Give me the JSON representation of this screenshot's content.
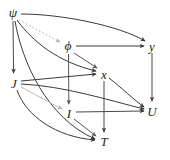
{
  "diagram": {
    "type": "directed-acyclic-graph",
    "background_color": "#ffffff",
    "default_edge_color": "#3a3a3a",
    "faded_edge_color": "#b0b0b0",
    "label_color": "#262626",
    "nodes": [
      {
        "id": "psi",
        "label": "ψ",
        "x": 13,
        "y": 13,
        "kind": "greek"
      },
      {
        "id": "phi",
        "label": "ϕ",
        "x": 68,
        "y": 46,
        "kind": "greek"
      },
      {
        "id": "y",
        "label": "y",
        "x": 152,
        "y": 46,
        "kind": "latin"
      },
      {
        "id": "J",
        "label": "J",
        "x": 14,
        "y": 83,
        "kind": "latin"
      },
      {
        "id": "x",
        "label": "x",
        "x": 104,
        "y": 74,
        "kind": "latin"
      },
      {
        "id": "I",
        "label": "I",
        "x": 69,
        "y": 113,
        "kind": "latin"
      },
      {
        "id": "U",
        "label": "U",
        "x": 152,
        "y": 111,
        "kind": "latin"
      },
      {
        "id": "T",
        "label": "T",
        "x": 104,
        "y": 141,
        "kind": "latin"
      }
    ],
    "edges": [
      {
        "id": "psi-phi",
        "from": "psi",
        "to": "phi",
        "style": "dotted",
        "color": "#b5b5b5",
        "shape": "straight"
      },
      {
        "id": "psi-J",
        "from": "psi",
        "to": "J",
        "style": "solid",
        "color": "#4a4a4a",
        "shape": "straight"
      },
      {
        "id": "psi-x",
        "from": "psi",
        "to": "x",
        "style": "solid",
        "color": "#3a3a3a",
        "shape": "curve"
      },
      {
        "id": "psi-y",
        "from": "psi",
        "to": "y",
        "style": "solid",
        "color": "#3a3a3a",
        "shape": "curve"
      },
      {
        "id": "psi-T",
        "from": "psi",
        "to": "T",
        "style": "solid",
        "color": "#3a3a3a",
        "shape": "curve"
      },
      {
        "id": "phi-x",
        "from": "phi",
        "to": "x",
        "style": "solid",
        "color": "#555555",
        "shape": "straight"
      },
      {
        "id": "phi-y",
        "from": "phi",
        "to": "y",
        "style": "solid",
        "color": "#3a3a3a",
        "shape": "straight"
      },
      {
        "id": "phi-I",
        "from": "phi",
        "to": "I",
        "style": "solid",
        "color": "#5a5a5a",
        "shape": "straight"
      },
      {
        "id": "J-x",
        "from": "J",
        "to": "x",
        "style": "solid",
        "color": "#3a3a3a",
        "shape": "straight"
      },
      {
        "id": "J-I",
        "from": "J",
        "to": "I",
        "style": "solid",
        "color": "#bdbdbd",
        "shape": "straight"
      },
      {
        "id": "J-U",
        "from": "J",
        "to": "U",
        "style": "solid",
        "color": "#3a3a3a",
        "shape": "curve"
      },
      {
        "id": "J-T",
        "from": "J",
        "to": "T",
        "style": "solid",
        "color": "#3a3a3a",
        "shape": "curve"
      },
      {
        "id": "x-U",
        "from": "x",
        "to": "U",
        "style": "solid",
        "color": "#3a3a3a",
        "shape": "curve"
      },
      {
        "id": "x-T",
        "from": "x",
        "to": "T",
        "style": "solid",
        "color": "#4a4a4a",
        "shape": "straight"
      },
      {
        "id": "I-U",
        "from": "I",
        "to": "U",
        "style": "solid",
        "color": "#4a4a4a",
        "shape": "straight"
      },
      {
        "id": "I-T",
        "from": "I",
        "to": "T",
        "style": "solid",
        "color": "#5a5a5a",
        "shape": "straight"
      },
      {
        "id": "y-U",
        "from": "y",
        "to": "U",
        "style": "solid",
        "color": "#4a4a4a",
        "shape": "straight"
      }
    ]
  }
}
